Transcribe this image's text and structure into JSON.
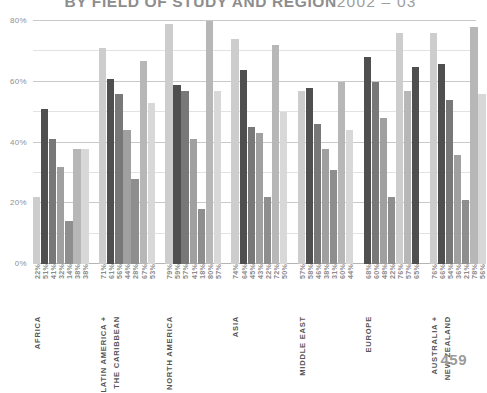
{
  "header": {
    "title_main": "BY FIELD OF STUDY AND REGION",
    "title_years": "2002 – 03",
    "page_number": "459"
  },
  "axis": {
    "y_ticks": [
      "0%",
      "20%",
      "40%",
      "60%",
      "80%"
    ]
  },
  "chart_data": {
    "type": "bar",
    "xlabel": "",
    "ylabel": "",
    "ylim": [
      0,
      80
    ],
    "y_ticks": [
      0,
      20,
      40,
      60,
      80
    ],
    "y_minor_ticks": [
      10,
      30,
      50,
      70
    ],
    "grid": true,
    "legend": "none",
    "value_suffix": "%",
    "categories": [
      "AFRICA",
      "LATIN AMERICA + THE CARIBBEAN",
      "NORTH AMERICA",
      "ASIA",
      "MIDDLE EAST",
      "EUROPE",
      "AUSTRALIA + NEW ZEALAND"
    ],
    "groups": [
      {
        "category": "AFRICA",
        "label_lines": [
          "AFRICA"
        ],
        "values": [
          22,
          51,
          41,
          32,
          14,
          38,
          38
        ],
        "labels": [
          "22%",
          "51%",
          "41%",
          "32%",
          "14%",
          "38%",
          "38%"
        ],
        "colors": [
          "#cdcdcd",
          "#4f4f4f",
          "#787878",
          "#a0a0a0",
          "#8e8e8e",
          "#b7b7b7",
          "#d8d8d8"
        ]
      },
      {
        "category": "LATIN AMERICA + THE CARIBBEAN",
        "label_lines": [
          "LATIN AMERICA +",
          "THE CARIBBEAN"
        ],
        "values": [
          71,
          61,
          56,
          44,
          28,
          67,
          53
        ],
        "labels": [
          "71%",
          "61%",
          "56%",
          "44%",
          "28%",
          "67%",
          "53%"
        ],
        "colors": [
          "#cdcdcd",
          "#4f4f4f",
          "#787878",
          "#a0a0a0",
          "#8e8e8e",
          "#b7b7b7",
          "#d8d8d8"
        ]
      },
      {
        "category": "NORTH AMERICA",
        "label_lines": [
          "NORTH AMERICA"
        ],
        "values": [
          79,
          59,
          57,
          41,
          18,
          80,
          57
        ],
        "labels": [
          "79%",
          "59%",
          "57%",
          "41%",
          "18%",
          "80%",
          "57%"
        ],
        "colors": [
          "#cdcdcd",
          "#4f4f4f",
          "#787878",
          "#a0a0a0",
          "#8e8e8e",
          "#b7b7b7",
          "#d8d8d8"
        ]
      },
      {
        "category": "ASIA",
        "label_lines": [
          "ASIA"
        ],
        "values": [
          74,
          64,
          45,
          43,
          22,
          72,
          50
        ],
        "labels": [
          "74%",
          "64%",
          "45%",
          "43%",
          "22%",
          "72%",
          "50%"
        ],
        "colors": [
          "#cdcdcd",
          "#4f4f4f",
          "#787878",
          "#a0a0a0",
          "#8e8e8e",
          "#b7b7b7",
          "#d8d8d8"
        ]
      },
      {
        "category": "MIDDLE EAST",
        "label_lines": [
          "MIDDLE EAST"
        ],
        "values": [
          57,
          58,
          46,
          38,
          31,
          60,
          44
        ],
        "labels": [
          "57%",
          "58%",
          "46%",
          "38%",
          "31%",
          "60%",
          "44%"
        ],
        "colors": [
          "#cdcdcd",
          "#4f4f4f",
          "#787878",
          "#a0a0a0",
          "#8e8e8e",
          "#b7b7b7",
          "#d8d8d8"
        ]
      },
      {
        "category": "EUROPE",
        "label_lines": [
          "EUROPE"
        ],
        "values": [
          68,
          60,
          48,
          22,
          76,
          57,
          65
        ],
        "labels": [
          "68%",
          "60%",
          "48%",
          "22%",
          "76%",
          "57%",
          "65%"
        ],
        "colors": [
          "#4f4f4f",
          "#787878",
          "#a0a0a0",
          "#8e8e8e",
          "#cdcdcd",
          "#b7b7b7",
          "#4f4f4f"
        ]
      },
      {
        "category": "AUSTRALIA + NEW ZEALAND",
        "label_lines": [
          "AUSTRALIA +",
          "NEW ZEALAND"
        ],
        "values": [
          76,
          66,
          54,
          36,
          21,
          78,
          56
        ],
        "labels": [
          "76%",
          "66%",
          "54%",
          "36%",
          "21%",
          "78%",
          "56%"
        ],
        "colors": [
          "#cdcdcd",
          "#4f4f4f",
          "#787878",
          "#a0a0a0",
          "#8e8e8e",
          "#b7b7b7",
          "#d8d8d8"
        ]
      }
    ]
  }
}
